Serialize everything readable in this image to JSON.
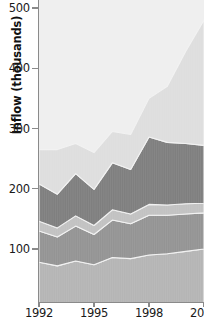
{
  "chart_data": {
    "type": "area",
    "stacked": true,
    "title": "",
    "xlabel": "",
    "ylabel": "Inflow (thousands)",
    "ylim": [
      0,
      500
    ],
    "xlim": [
      1992,
      2001
    ],
    "grid": false,
    "legend": "none",
    "y_ticks": [
      500,
      400,
      300,
      200,
      100
    ],
    "x_ticks": [
      1992,
      1995,
      1998,
      2001
    ],
    "x_tick_labels": [
      "1992",
      "1995",
      "1998",
      "200"
    ],
    "x": [
      1992,
      1993,
      1994,
      1995,
      1996,
      1997,
      1998,
      1999,
      2000,
      2001
    ],
    "series": [
      {
        "name": "series-1",
        "color": "#b5b5b5",
        "values": [
          78,
          72,
          80,
          74,
          86,
          84,
          90,
          92,
          96,
          100
        ]
      },
      {
        "name": "series-2",
        "color": "#949494",
        "values": [
          52,
          48,
          58,
          50,
          62,
          58,
          66,
          64,
          62,
          60
        ]
      },
      {
        "name": "series-3",
        "color": "#c2c2c2",
        "values": [
          16,
          15,
          17,
          15,
          17,
          16,
          18,
          17,
          17,
          16
        ]
      },
      {
        "name": "series-4",
        "color": "#7f7f7f",
        "values": [
          62,
          56,
          70,
          60,
          78,
          74,
          112,
          104,
          100,
          96
        ]
      },
      {
        "name": "series-5",
        "color": "#dedede",
        "values": [
          57,
          74,
          50,
          61,
          52,
          58,
          64,
          93,
          153,
          208
        ]
      }
    ],
    "stack_totals": [
      265,
      265,
      275,
      260,
      295,
      290,
      350,
      370,
      428,
      480
    ],
    "plot_background": "#efefef"
  }
}
